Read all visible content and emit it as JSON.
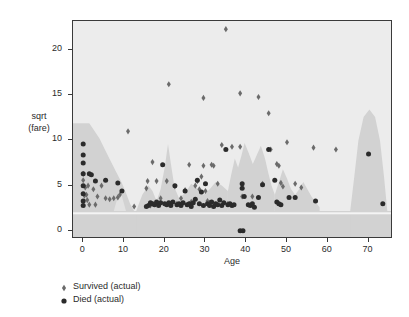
{
  "chart_data": {
    "type": "scatter",
    "title": "",
    "xlabel": "Age",
    "ylabel": "sqrt\n(fare)",
    "ylabel_line1": "sqrt",
    "ylabel_line2": "(fare)",
    "xlim": [
      -2.5,
      76
    ],
    "ylim": [
      -0.9,
      23.2
    ],
    "xticks": [
      0,
      10,
      20,
      30,
      40,
      50,
      60,
      70
    ],
    "yticks": [
      0,
      5,
      10,
      15,
      20
    ],
    "grid": false,
    "legend_position": "below-left",
    "background_color": "#ececec",
    "region_color": "#d2d2d2",
    "frame_color": "#3a3a3a",
    "legend": [
      {
        "name": "Survived (actual)",
        "marker": "diamond",
        "color": "#6b6b6b"
      },
      {
        "name": "Died (actual)",
        "marker": "circle",
        "color": "#2b2b2b"
      }
    ],
    "series": [
      {
        "name": "Survived (actual)",
        "marker": "diamond",
        "color": "#6b6b6b",
        "points": [
          [
            35.0,
            22.3
          ],
          [
            21.0,
            16.2
          ],
          [
            29.5,
            14.7
          ],
          [
            38.5,
            15.2
          ],
          [
            43.0,
            14.8
          ],
          [
            45.5,
            13.0
          ],
          [
            11.0,
            11.0
          ],
          [
            0.0,
            6.3
          ],
          [
            0.0,
            5.6
          ],
          [
            0.5,
            4.8
          ],
          [
            0.8,
            4.0
          ],
          [
            1.0,
            3.4
          ],
          [
            1.5,
            2.9
          ],
          [
            2.5,
            4.6
          ],
          [
            3.5,
            3.8
          ],
          [
            5.5,
            3.6
          ],
          [
            6.5,
            3.5
          ],
          [
            7.5,
            3.6
          ],
          [
            9.0,
            4.0
          ],
          [
            12.5,
            2.7
          ],
          [
            15.5,
            4.7
          ],
          [
            15.8,
            5.5
          ],
          [
            17.0,
            7.6
          ],
          [
            18.0,
            5.5
          ],
          [
            19.0,
            3.6
          ],
          [
            20.5,
            5.5
          ],
          [
            22.5,
            4.9
          ],
          [
            24.0,
            3.6
          ],
          [
            25.0,
            4.5
          ],
          [
            26.0,
            7.3
          ],
          [
            27.5,
            5.0
          ],
          [
            28.0,
            5.5
          ],
          [
            28.5,
            4.6
          ],
          [
            29.0,
            6.0
          ],
          [
            29.5,
            7.2
          ],
          [
            30.0,
            4.4
          ],
          [
            30.5,
            3.3
          ],
          [
            31.5,
            7.3
          ],
          [
            32.0,
            7.2
          ],
          [
            33.0,
            5.2
          ],
          [
            34.0,
            9.5
          ],
          [
            35.5,
            3.0
          ],
          [
            36.5,
            9.3
          ],
          [
            38.5,
            9.3
          ],
          [
            39.0,
            3.8
          ],
          [
            41.5,
            3.8
          ],
          [
            44.0,
            5.2
          ],
          [
            47.5,
            7.4
          ],
          [
            48.0,
            7.2
          ],
          [
            48.5,
            5.3
          ],
          [
            49.0,
            4.9
          ],
          [
            50.0,
            9.8
          ],
          [
            52.0,
            5.2
          ],
          [
            53.5,
            4.8
          ],
          [
            56.5,
            9.2
          ],
          [
            62.0,
            9.0
          ],
          [
            4.5,
            5.0
          ],
          [
            8.5,
            3.7
          ],
          [
            16.5,
            2.8
          ],
          [
            23.0,
            3.0
          ],
          [
            26.5,
            3.2
          ],
          [
            31.0,
            3.1
          ],
          [
            46.0,
            9.0
          ],
          [
            3.0,
            2.9
          ],
          [
            0.3,
            3.9
          ],
          [
            1.2,
            5.0
          ]
        ]
      },
      {
        "name": "Died (actual)",
        "marker": "circle",
        "color": "#2b2b2b",
        "points": [
          [
            0.0,
            9.6
          ],
          [
            0.0,
            8.4
          ],
          [
            0.0,
            7.5
          ],
          [
            0.0,
            6.3
          ],
          [
            0.0,
            5.0
          ],
          [
            0.0,
            4.1
          ],
          [
            0.0,
            3.3
          ],
          [
            0.0,
            2.8
          ],
          [
            1.5,
            6.3
          ],
          [
            3.0,
            5.5
          ],
          [
            5.5,
            5.6
          ],
          [
            8.5,
            5.3
          ],
          [
            9.5,
            4.4
          ],
          [
            16.0,
            2.8
          ],
          [
            16.5,
            3.1
          ],
          [
            17.0,
            3.0
          ],
          [
            17.5,
            2.9
          ],
          [
            18.0,
            3.2
          ],
          [
            18.5,
            2.8
          ],
          [
            19.0,
            3.1
          ],
          [
            19.5,
            7.3
          ],
          [
            20.0,
            3.0
          ],
          [
            20.5,
            2.9
          ],
          [
            21.0,
            3.1
          ],
          [
            21.5,
            2.8
          ],
          [
            22.0,
            3.2
          ],
          [
            22.5,
            5.0
          ],
          [
            23.0,
            2.9
          ],
          [
            23.5,
            3.0
          ],
          [
            24.0,
            2.8
          ],
          [
            24.5,
            3.1
          ],
          [
            25.0,
            4.4
          ],
          [
            25.5,
            2.9
          ],
          [
            26.0,
            3.0
          ],
          [
            26.5,
            2.7
          ],
          [
            27.0,
            3.1
          ],
          [
            27.5,
            3.5
          ],
          [
            28.0,
            5.6
          ],
          [
            28.5,
            3.0
          ],
          [
            29.0,
            4.3
          ],
          [
            29.5,
            2.8
          ],
          [
            30.0,
            5.2
          ],
          [
            30.5,
            3.0
          ],
          [
            31.0,
            2.8
          ],
          [
            31.5,
            3.2
          ],
          [
            32.0,
            2.7
          ],
          [
            32.5,
            3.0
          ],
          [
            33.0,
            2.9
          ],
          [
            33.5,
            3.4
          ],
          [
            34.0,
            2.8
          ],
          [
            34.5,
            3.1
          ],
          [
            35.0,
            9.0
          ],
          [
            35.5,
            2.9
          ],
          [
            36.0,
            3.0
          ],
          [
            36.5,
            2.8
          ],
          [
            38.5,
            0.0
          ],
          [
            39.2,
            0.0
          ],
          [
            39.0,
            5.2
          ],
          [
            39.0,
            4.7
          ],
          [
            39.5,
            3.8
          ],
          [
            40.5,
            2.9
          ],
          [
            41.0,
            2.8
          ],
          [
            41.5,
            3.0
          ],
          [
            42.0,
            2.6
          ],
          [
            44.0,
            5.1
          ],
          [
            45.5,
            9.0
          ],
          [
            47.0,
            5.6
          ],
          [
            47.5,
            3.2
          ],
          [
            48.0,
            3.0
          ],
          [
            48.5,
            2.9
          ],
          [
            50.5,
            3.7
          ],
          [
            52.0,
            3.7
          ],
          [
            57.0,
            3.3
          ],
          [
            70.0,
            8.5
          ],
          [
            73.5,
            3.0
          ],
          [
            2.0,
            6.2
          ],
          [
            15.5,
            2.7
          ],
          [
            37.0,
            2.9
          ],
          [
            43.0,
            3.7
          ]
        ]
      }
    ]
  }
}
